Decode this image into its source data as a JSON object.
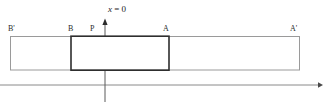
{
  "figure": {
    "background_color": "#ffffff",
    "canvas": {
      "width": 325,
      "height": 102
    },
    "axis": {
      "vertical_axis_label": "x = 0",
      "vertical_axis_label_parts": {
        "variable": "x",
        "equals": " = ",
        "value": "0"
      },
      "vertical_axis_x": 105,
      "vertical_axis_color": "#4a4a4a",
      "horizontal_axis_y": 85,
      "horizontal_axis_color": "#8a8a8a",
      "arrow_up_icon": "arrow-up-icon",
      "arrow_right_icon": "arrow-right-icon"
    },
    "outer_rectangle": {
      "name": "outer-interval",
      "left_label": "B'",
      "right_label": "A'",
      "x_left": 10,
      "x_right": 300,
      "y_top": 36,
      "y_bottom": 70,
      "stroke_color": "#9a9a9a",
      "stroke_width": 1,
      "fill": "#ffffff"
    },
    "inner_rectangle": {
      "name": "inner-interval",
      "left_label": "B",
      "right_label": "A",
      "x_left": 71,
      "x_right": 169,
      "y_top": 36,
      "y_bottom": 70,
      "stroke_color": "#2e2e2e",
      "stroke_width": 1.6,
      "fill": "none"
    },
    "points": [
      {
        "id": "B-prime",
        "label": "B'",
        "x": 11,
        "label_x": 8,
        "label_y": 27
      },
      {
        "id": "B",
        "label": "B",
        "x": 71,
        "label_x": 68,
        "label_y": 27
      },
      {
        "id": "P",
        "label": "P",
        "x": 93,
        "label_x": 90,
        "label_y": 27
      },
      {
        "id": "A",
        "label": "A",
        "x": 166,
        "label_x": 163,
        "label_y": 27
      },
      {
        "id": "A-prime",
        "label": "A'",
        "x": 294,
        "label_x": 290,
        "label_y": 27
      }
    ]
  }
}
